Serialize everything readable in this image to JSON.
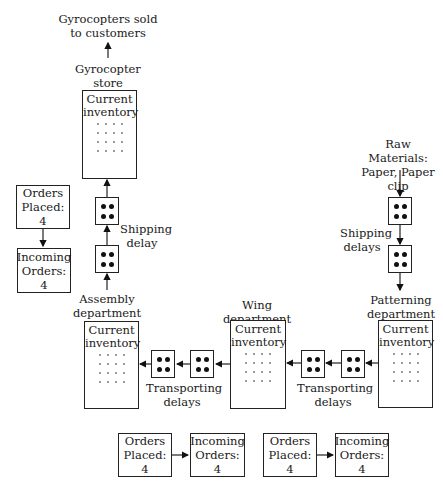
{
  "diagram": {
    "sink_label": "Gyrocopters sold to customers",
    "store": {
      "label": "Gyrocopter store",
      "inventory_title": "Current inventory",
      "inventory_units": 16
    },
    "store_shipping": {
      "label": "Shipping delay",
      "delay_boxes": 2,
      "units_per_box": 4
    },
    "assembly": {
      "label": "Assembly department",
      "inventory_title": "Current inventory",
      "inventory_units": 16
    },
    "wing": {
      "label": "Wing department",
      "inventory_title": "Current inventory",
      "inventory_units": 16
    },
    "patterning": {
      "label": "Patterning department",
      "inventory_title": "Current inventory",
      "inventory_units": 16
    },
    "raw_materials": {
      "label": "Raw Materials: Paper, Paper clip"
    },
    "raw_shipping": {
      "label": "Shipping delays",
      "delay_boxes": 2,
      "units_per_box": 4
    },
    "transport_left": {
      "label": "Transporting delays",
      "delay_boxes": 2,
      "units_per_box": 4
    },
    "transport_right": {
      "label": "Transporting delays",
      "delay_boxes": 2,
      "units_per_box": 4
    },
    "orders": [
      {
        "placed": "Orders Placed: 4",
        "incoming": "Incoming Orders: 4"
      },
      {
        "placed": "Orders Placed: 4",
        "incoming": "Incoming Orders: 4"
      },
      {
        "placed": "Orders Placed: 4",
        "incoming": "Incoming Orders: 4"
      }
    ]
  }
}
